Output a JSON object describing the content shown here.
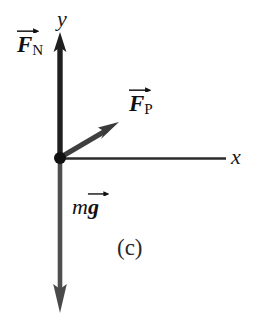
{
  "figure": {
    "kind": "free-body-diagram",
    "panel_label": "(c)",
    "background_color": "#ffffff",
    "ink_color": "#1a1a1a",
    "axes": {
      "x_label": "x",
      "y_label": "y",
      "origin_label": "origin-dot"
    },
    "vectors": [
      {
        "id": "normal-force",
        "symbol": "F",
        "subscript": "N",
        "accent": "arrow",
        "label_text": "F⃗N",
        "direction": "up",
        "color": "#1f1f1f"
      },
      {
        "id": "applied-force",
        "symbol": "F",
        "subscript": "P",
        "accent": "arrow",
        "label_text": "F⃗P",
        "direction": "up-right",
        "color": "#3a3a3a"
      },
      {
        "id": "weight",
        "symbol": "g",
        "prefix": "m",
        "accent": "arrow",
        "label_text": "mg⃗",
        "direction": "down",
        "color": "#4a4a4a"
      }
    ]
  },
  "labels": {
    "y_axis": "y",
    "x_axis": "x",
    "normal_force_symbol": "F",
    "normal_force_subscript": "N",
    "applied_force_symbol": "F",
    "applied_force_subscript": "P",
    "weight_prefix": "m",
    "weight_symbol": "g",
    "panel": "(c)"
  }
}
